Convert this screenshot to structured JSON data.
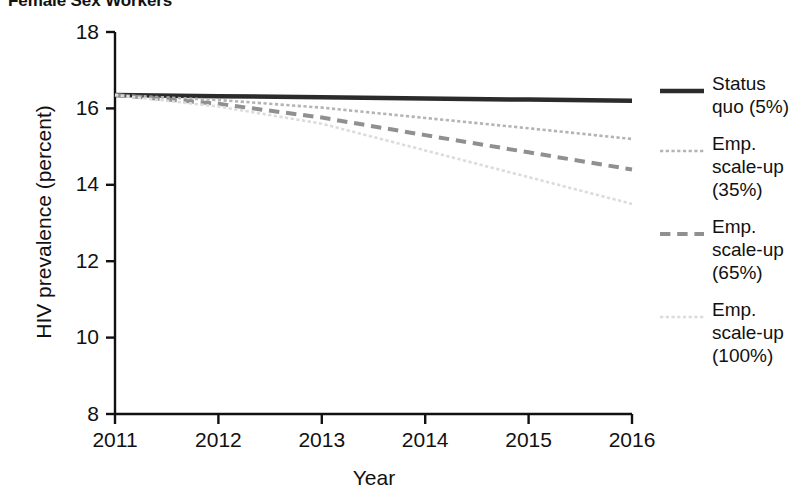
{
  "chart_data": {
    "type": "line",
    "title": "Female Sex Workers",
    "subtitle": "",
    "xlabel": "Year",
    "ylabel": "HIV prevalence (percent)",
    "x": [
      2011,
      2012,
      2013,
      2014,
      2015,
      2016
    ],
    "xlim": [
      2011,
      2016
    ],
    "ylim": [
      8,
      18
    ],
    "x_ticks": [
      "2011",
      "2012",
      "2013",
      "2014",
      "2015",
      "2016"
    ],
    "y_ticks": [
      "8",
      "10",
      "12",
      "14",
      "16",
      "18"
    ],
    "grid": false,
    "legend_position": "right",
    "series": [
      {
        "name": "Status quo (5%)",
        "label_lines": [
          "Status",
          "quo (5%)"
        ],
        "values": [
          16.35,
          16.32,
          16.29,
          16.26,
          16.23,
          16.2
        ],
        "color": "#2b2b2b",
        "style": "solid",
        "width": 4.5
      },
      {
        "name": "Emp. scale-up (35%)",
        "label_lines": [
          "Emp.",
          "scale-up",
          "(35%)"
        ],
        "values": [
          16.35,
          16.22,
          16.02,
          15.75,
          15.48,
          15.2
        ],
        "color": "#b4b4b4",
        "style": "dotted",
        "width": 2.6
      },
      {
        "name": "Emp. scale-up (65%)",
        "label_lines": [
          "Emp.",
          "scale-up",
          "(65%)"
        ],
        "values": [
          16.35,
          16.12,
          15.76,
          15.3,
          14.85,
          14.4
        ],
        "color": "#909090",
        "style": "dashed",
        "width": 4.0
      },
      {
        "name": "Emp. scale-up (100%)",
        "label_lines": [
          "Emp.",
          "scale-up",
          "(100%)"
        ],
        "values": [
          16.35,
          16.05,
          15.6,
          14.9,
          14.2,
          13.5
        ],
        "color": "#dcdcdc",
        "style": "dotted",
        "width": 2.6
      }
    ]
  },
  "axes": {
    "y_title": "HIV prevalence (percent)",
    "x_title": "Year"
  },
  "legend": {
    "entries": [
      {
        "lines": "Status quo (5%)"
      },
      {
        "lines": "Emp. scale-up (35%)"
      },
      {
        "lines": "Emp. scale-up (65%)"
      },
      {
        "lines": "Emp. scale-up (100%)"
      }
    ]
  },
  "colors": {
    "axis": "#111111",
    "background": "#ffffff",
    "series_status_quo": "#2b2b2b",
    "series_35": "#b4b4b4",
    "series_65": "#909090",
    "series_100": "#dcdcdc"
  }
}
